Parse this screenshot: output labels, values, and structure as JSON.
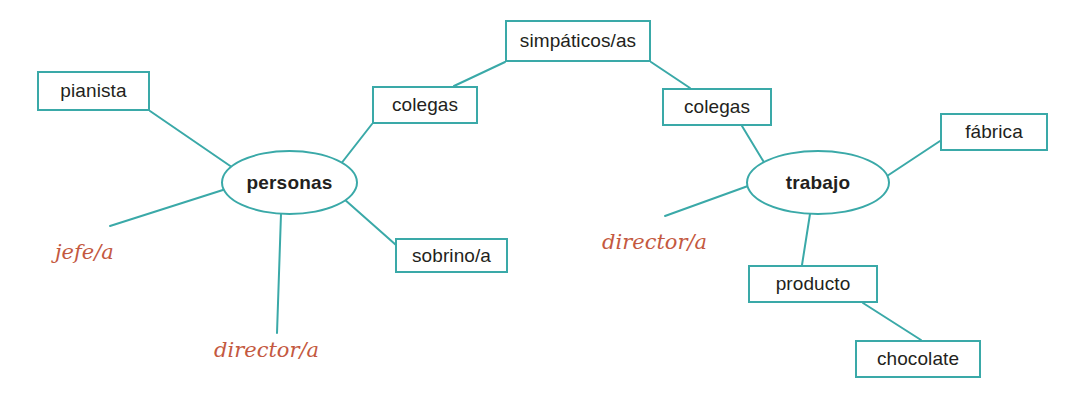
{
  "diagram": {
    "type": "mind-map",
    "colors": {
      "node_border": "#3aa9a8",
      "edge": "#3aa9a8",
      "node_text": "#231f20",
      "handwriting": "#c4593f",
      "background": "#ffffff"
    },
    "nodes": [
      {
        "id": "simpaticos",
        "label": "simpáticos/as",
        "shape": "box",
        "x": 505,
        "y": 20,
        "w": 146,
        "h": 42
      },
      {
        "id": "pianista",
        "label": "pianista",
        "shape": "box",
        "x": 37,
        "y": 71,
        "w": 113,
        "h": 40
      },
      {
        "id": "colegas-left",
        "label": "colegas",
        "shape": "box",
        "x": 372,
        "y": 86,
        "w": 106,
        "h": 38
      },
      {
        "id": "colegas-right",
        "label": "colegas",
        "shape": "box",
        "x": 662,
        "y": 88,
        "w": 110,
        "h": 38
      },
      {
        "id": "fabrica",
        "label": "fábrica",
        "shape": "box",
        "x": 940,
        "y": 113,
        "w": 108,
        "h": 38
      },
      {
        "id": "personas",
        "label": "personas",
        "shape": "ellipse",
        "x": 221,
        "y": 150,
        "w": 137,
        "h": 65
      },
      {
        "id": "trabajo",
        "label": "trabajo",
        "shape": "ellipse",
        "x": 746,
        "y": 150,
        "w": 144,
        "h": 65
      },
      {
        "id": "director-right",
        "label": "director/a",
        "shape": "handwriting",
        "x": 602,
        "y": 228,
        "w": 120,
        "h": 28
      },
      {
        "id": "sobrino",
        "label": "sobrino/a",
        "shape": "box",
        "x": 395,
        "y": 238,
        "w": 113,
        "h": 35
      },
      {
        "id": "jefe",
        "label": "jefe/a",
        "shape": "handwriting",
        "x": 55,
        "y": 238,
        "w": 82,
        "h": 28
      },
      {
        "id": "producto",
        "label": "producto",
        "shape": "box",
        "x": 748,
        "y": 265,
        "w": 130,
        "h": 38
      },
      {
        "id": "director-left",
        "label": "director/a",
        "shape": "handwriting",
        "x": 214,
        "y": 336,
        "w": 120,
        "h": 28
      },
      {
        "id": "chocolate",
        "label": "chocolate",
        "shape": "box",
        "x": 855,
        "y": 340,
        "w": 126,
        "h": 38
      }
    ],
    "edges": [
      {
        "from": "pianista",
        "to": "personas",
        "x1": 150,
        "y1": 111,
        "x2": 239,
        "y2": 172
      },
      {
        "from": "colegas-left",
        "to": "personas",
        "x1": 372,
        "y1": 124,
        "x2": 340,
        "y2": 165
      },
      {
        "from": "simpaticos",
        "to": "colegas-left",
        "x1": 505,
        "y1": 62,
        "x2": 454,
        "y2": 86
      },
      {
        "from": "personas",
        "to": "sobrino",
        "x1": 344,
        "y1": 199,
        "x2": 396,
        "y2": 245
      },
      {
        "from": "personas",
        "to": "director-left",
        "x1": 281,
        "y1": 214,
        "x2": 277,
        "y2": 333
      },
      {
        "from": "personas",
        "to": "jefe",
        "x1": 226,
        "y1": 189,
        "x2": 110,
        "y2": 226
      },
      {
        "from": "simpaticos",
        "to": "colegas-right",
        "x1": 651,
        "y1": 62,
        "x2": 690,
        "y2": 88
      },
      {
        "from": "colegas-right",
        "to": "trabajo",
        "x1": 742,
        "y1": 126,
        "x2": 765,
        "y2": 164
      },
      {
        "from": "fabrica",
        "to": "trabajo",
        "x1": 940,
        "y1": 141,
        "x2": 881,
        "y2": 180
      },
      {
        "from": "trabajo",
        "to": "director-right",
        "x1": 748,
        "y1": 186,
        "x2": 665,
        "y2": 216
      },
      {
        "from": "trabajo",
        "to": "producto",
        "x1": 810,
        "y1": 214,
        "x2": 802,
        "y2": 265
      },
      {
        "from": "producto",
        "to": "chocolate",
        "x1": 863,
        "y1": 303,
        "x2": 921,
        "y2": 340
      }
    ]
  }
}
